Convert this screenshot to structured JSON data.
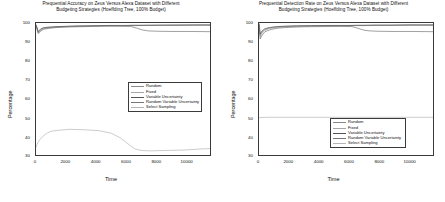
{
  "figure": {
    "width": 445,
    "height": 202,
    "background": "#ffffff"
  },
  "series_colors": {
    "random": "#808080",
    "fixed": "#9a9a9a",
    "variable_uncertainty": "#4d4d4d",
    "random_variable_uncertainty": "#6e6e6e",
    "select_sampling": "#b0b0b0"
  },
  "legend": {
    "items": [
      {
        "label": "Random",
        "color": "#8a8a8a"
      },
      {
        "label": "Fixed",
        "color": "#a5a5a5"
      },
      {
        "label": "Variable Uncertainty",
        "color": "#555555"
      },
      {
        "label": "Random Variable Uncertainty",
        "color": "#777777"
      },
      {
        "label": "Select Sampling",
        "color": "#b5b5b5"
      }
    ]
  },
  "chart_data": [
    {
      "type": "line",
      "panel": "left",
      "title": "Prequential Accuracy on Zeus Versus Alexa Dataset with Different Budgeting Strategies (Hoeffding Tree, 100% Budget)",
      "title_line1": "Prequential Accuracy on Zeus Versus Alexa Dataset with Different",
      "title_line2": "Budgeting Strategies (Hoeffding Tree, 100% Budget)",
      "xlabel": "Time",
      "ylabel": "Percentage",
      "xlim": [
        0,
        11600
      ],
      "ylim": [
        30,
        100
      ],
      "xticks": [
        0,
        2000,
        4000,
        6000,
        8000,
        10000
      ],
      "yticks": [
        30,
        40,
        50,
        60,
        70,
        80,
        90,
        100
      ],
      "grid": false,
      "legend_position": "center-right",
      "series": [
        {
          "name": "Random",
          "x": [
            0,
            150,
            300,
            500,
            800,
            1200,
            1800,
            2600,
            3600,
            4800,
            6000,
            6400,
            6800,
            7400,
            8400,
            9600,
            10800,
            11600
          ],
          "y": [
            99.0,
            95.2,
            96.4,
            97.3,
            97.6,
            97.9,
            98.1,
            98.3,
            98.5,
            98.6,
            98.6,
            98.7,
            98.7,
            98.8,
            98.8,
            98.9,
            98.9,
            98.9
          ]
        },
        {
          "name": "Fixed",
          "x": [
            0,
            150,
            300,
            500,
            800,
            1200,
            1800,
            2600,
            3600,
            4800,
            6000,
            6400,
            6800,
            7400,
            8400,
            9600,
            10800,
            11600
          ],
          "y": [
            98.8,
            94.8,
            96.0,
            97.0,
            97.4,
            97.7,
            98.0,
            98.2,
            98.4,
            98.5,
            98.5,
            98.6,
            98.6,
            98.7,
            98.7,
            98.8,
            98.8,
            98.8
          ]
        },
        {
          "name": "Variable Uncertainty",
          "x": [
            0,
            150,
            300,
            500,
            800,
            1200,
            1800,
            2600,
            3600,
            4800,
            6000,
            6400,
            6800,
            7400,
            8400,
            9600,
            10800,
            11600
          ],
          "y": [
            99.2,
            95.5,
            96.8,
            97.5,
            97.8,
            98.0,
            98.2,
            98.4,
            98.5,
            98.7,
            98.7,
            98.8,
            98.8,
            98.8,
            98.9,
            98.9,
            99.0,
            99.0
          ]
        },
        {
          "name": "Random Variable Uncertainty",
          "x": [
            0,
            150,
            300,
            500,
            900,
            1400,
            2200,
            3400,
            4600,
            5800,
            6300,
            6700,
            7100,
            7500,
            8200,
            9200,
            10400,
            11600
          ],
          "y": [
            98.5,
            94.3,
            95.6,
            96.7,
            97.2,
            97.6,
            97.9,
            98.1,
            98.3,
            98.3,
            98.2,
            97.3,
            96.3,
            95.8,
            95.6,
            95.5,
            95.5,
            95.4
          ]
        },
        {
          "name": "Select Sampling",
          "x": [
            0,
            120,
            260,
            420,
            700,
            1000,
            1500,
            2200,
            3200,
            4200,
            5000,
            5600,
            6200,
            6600,
            7000,
            7600,
            8600,
            9800,
            11000,
            11600
          ],
          "y": [
            34.0,
            36.5,
            38.2,
            39.6,
            41.4,
            42.6,
            43.1,
            43.6,
            43.4,
            42.9,
            41.6,
            39.2,
            35.5,
            33.2,
            32.4,
            32.2,
            32.4,
            32.6,
            33.2,
            33.4
          ]
        }
      ]
    },
    {
      "type": "line",
      "panel": "right",
      "title": "Prequential Detection Rate on Zeus Versus Alexa Dataset with Different Budgeting Strategies (Hoeffding Tree, 100% Budget)",
      "title_line1": "Prequential Detection Rate on Zeus Versus Alexa Dataset with Different",
      "title_line2": "Budgeting Strategies (Hoeffding Tree, 100% Budget)",
      "xlabel": "Time",
      "ylabel": "Percentage",
      "xlim": [
        0,
        11600
      ],
      "ylim": [
        30,
        100
      ],
      "xticks": [
        0,
        2000,
        4000,
        6000,
        8000,
        10000
      ],
      "yticks": [
        30,
        40,
        50,
        60,
        70,
        80,
        90,
        100
      ],
      "grid": false,
      "legend_position": "lower-right",
      "series": [
        {
          "name": "Random",
          "x": [
            0,
            80,
            200,
            400,
            700,
            1100,
            1700,
            2500,
            3500,
            4800,
            6000,
            6500,
            7000,
            7800,
            8800,
            10000,
            11000,
            11600
          ],
          "y": [
            99.5,
            93.5,
            95.2,
            96.6,
            97.4,
            97.9,
            98.2,
            98.4,
            98.5,
            98.6,
            98.6,
            98.7,
            98.7,
            98.8,
            98.8,
            98.9,
            98.9,
            98.9
          ]
        },
        {
          "name": "Fixed",
          "x": [
            0,
            80,
            200,
            400,
            700,
            1100,
            1700,
            2500,
            3500,
            4800,
            6000,
            6500,
            7000,
            7800,
            8800,
            10000,
            11000,
            11600
          ],
          "y": [
            99.2,
            92.8,
            94.6,
            96.2,
            97.1,
            97.6,
            98.0,
            98.2,
            98.4,
            98.5,
            98.5,
            98.6,
            98.6,
            98.7,
            98.7,
            98.8,
            98.8,
            98.8
          ]
        },
        {
          "name": "Variable Uncertainty",
          "x": [
            0,
            80,
            200,
            400,
            700,
            1100,
            1700,
            2500,
            3500,
            4800,
            6000,
            6500,
            7000,
            7800,
            8800,
            10000,
            11000,
            11600
          ],
          "y": [
            99.8,
            94.2,
            95.8,
            97.0,
            97.6,
            98.0,
            98.3,
            98.5,
            98.6,
            98.7,
            98.7,
            98.8,
            98.8,
            98.9,
            98.9,
            99.0,
            99.0,
            99.0
          ]
        },
        {
          "name": "Random Variable Uncertainty",
          "x": [
            0,
            80,
            200,
            400,
            800,
            1300,
            2000,
            3000,
            4200,
            5400,
            6200,
            6600,
            7000,
            7400,
            8000,
            9000,
            10200,
            11600
          ],
          "y": [
            99.0,
            91.5,
            93.5,
            95.4,
            96.6,
            97.3,
            97.7,
            98.0,
            98.1,
            98.2,
            98.1,
            97.2,
            96.2,
            95.8,
            95.6,
            95.5,
            95.5,
            95.4
          ]
        },
        {
          "name": "Select Sampling",
          "x": [
            0,
            200,
            600,
            1400,
            3000,
            5000,
            7000,
            9000,
            11000,
            11600
          ],
          "y": [
            49.8,
            49.9,
            50.0,
            50.0,
            50.0,
            50.0,
            50.0,
            50.0,
            50.0,
            50.0
          ]
        }
      ]
    }
  ]
}
